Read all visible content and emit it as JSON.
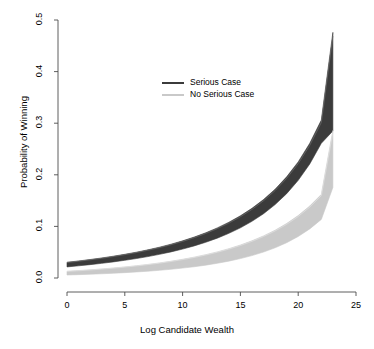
{
  "chart_data": {
    "type": "area",
    "title": "",
    "xlabel": "Log Candidate Wealth",
    "ylabel": "Probability of Winning",
    "xlim": [
      0,
      25
    ],
    "ylim": [
      0.0,
      0.5
    ],
    "xticks": [
      0,
      5,
      10,
      15,
      20,
      25
    ],
    "xtick_labels": [
      "0",
      "5",
      "10",
      "15",
      "20",
      "25"
    ],
    "yticks": [
      0.0,
      0.1,
      0.2,
      0.3,
      0.4,
      0.5
    ],
    "ytick_labels": [
      "0.0",
      "0.1",
      "0.2",
      "0.3",
      "0.4",
      "0.5"
    ],
    "grid": false,
    "legend_position": "upper center",
    "x": [
      0,
      1,
      2,
      3,
      4,
      5,
      6,
      7,
      8,
      9,
      10,
      11,
      12,
      13,
      14,
      15,
      16,
      17,
      18,
      19,
      20,
      21,
      22,
      23
    ],
    "series": [
      {
        "name": "Serious Case",
        "color": "#3b3b3b",
        "kind": "confidence-band",
        "upper": [
          0.0305,
          0.033,
          0.0358,
          0.0388,
          0.0422,
          0.0459,
          0.05,
          0.0546,
          0.0597,
          0.0655,
          0.072,
          0.0793,
          0.0876,
          0.0971,
          0.108,
          0.1205,
          0.135,
          0.152,
          0.172,
          0.196,
          0.225,
          0.261,
          0.306,
          0.365
        ],
        "lower": [
          0.0215,
          0.0236,
          0.0259,
          0.0284,
          0.0312,
          0.0343,
          0.0377,
          0.0415,
          0.0458,
          0.0506,
          0.056,
          0.0622,
          0.0692,
          0.0772,
          0.0865,
          0.0972,
          0.1098,
          0.1246,
          0.1422,
          0.1634,
          0.1892,
          0.221,
          0.261,
          0.312
        ],
        "upper_at_23": 0.476,
        "lower_at_23": 0.285
      },
      {
        "name": "No Serious Case",
        "color": "#c9c9c9",
        "kind": "confidence-band",
        "upper": [
          0.013,
          0.0143,
          0.0158,
          0.0175,
          0.0193,
          0.0214,
          0.0237,
          0.0263,
          0.0292,
          0.0325,
          0.0362,
          0.0404,
          0.0452,
          0.0506,
          0.0568,
          0.0639,
          0.0721,
          0.0816,
          0.0926,
          0.1056,
          0.121,
          0.1395,
          0.162,
          0.189
        ],
        "lower": [
          0.0058,
          0.0065,
          0.0073,
          0.0082,
          0.0092,
          0.0104,
          0.0117,
          0.0132,
          0.0149,
          0.0169,
          0.0192,
          0.0218,
          0.0249,
          0.0285,
          0.0327,
          0.0376,
          0.0434,
          0.0503,
          0.0585,
          0.0684,
          0.0804,
          0.0952,
          0.1135,
          0.136
        ],
        "upper_at_23": 0.286,
        "lower_at_23": 0.1755
      }
    ],
    "legend": [
      {
        "label": "Serious Case",
        "color": "#3b3b3b"
      },
      {
        "label": "No Serious Case",
        "color": "#c9c9c9"
      }
    ]
  },
  "colors": {
    "axis": "#4d4d4d",
    "serious": "#3b3b3b",
    "no_serious": "#c9c9c9",
    "background": "#ffffff"
  }
}
